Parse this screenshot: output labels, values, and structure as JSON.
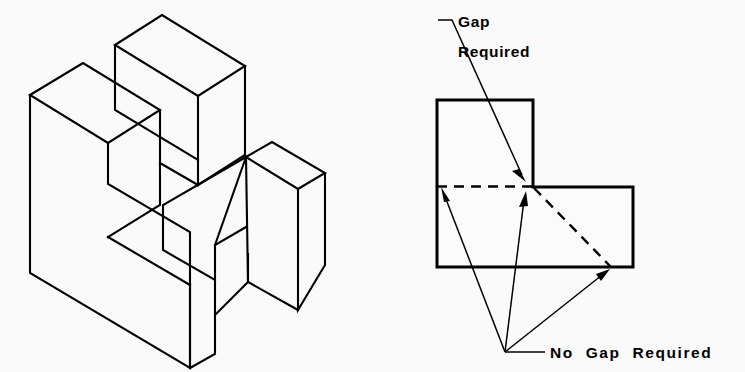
{
  "figure": {
    "background_color": "#fafafa",
    "line_color": "#000000",
    "fill_color": "#fbfbfb"
  },
  "isometric_view": {
    "name": "isometric-pictorial",
    "description": "Stepped block object drawn in isometric projection"
  },
  "orthographic_view": {
    "name": "orthographic-top-view",
    "description": "L-shaped stepped outline with hidden dashed edges"
  },
  "annotations": {
    "gap_required": {
      "line1": "Gap",
      "line2": "Required"
    },
    "no_gap_required": {
      "text": "No  Gap  Required"
    }
  }
}
